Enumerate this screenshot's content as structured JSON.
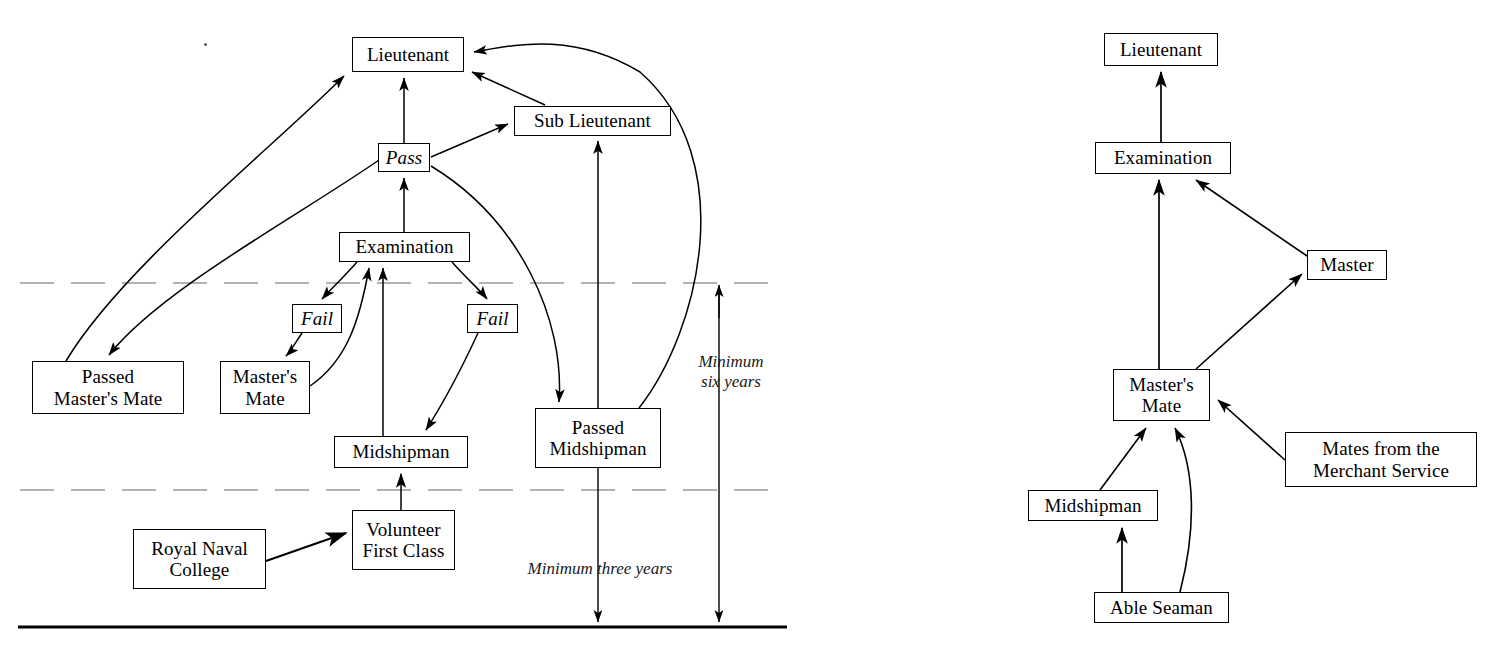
{
  "figure": {
    "kind": "flow-diagram-pair",
    "background": "#ffffff",
    "line_color": "#000000"
  },
  "left_diagram": {
    "name": "executive-officer-career-paths",
    "nodes": [
      {
        "id": "lieutenant",
        "label": "Lieutenant",
        "x": 352,
        "y": 37,
        "w": 112,
        "h": 35,
        "style": "plain"
      },
      {
        "id": "sub_lieutenant",
        "label": "Sub Lieutenant",
        "x": 514,
        "y": 106,
        "w": 157,
        "h": 30,
        "style": "plain"
      },
      {
        "id": "pass",
        "label": "Pass",
        "x": 378,
        "y": 143,
        "w": 52,
        "h": 29,
        "style": "italic"
      },
      {
        "id": "examination",
        "label": "Examination",
        "x": 339,
        "y": 232,
        "w": 131,
        "h": 30,
        "style": "plain"
      },
      {
        "id": "fail_left",
        "label": "Fail",
        "x": 292,
        "y": 304,
        "w": 50,
        "h": 29,
        "style": "italic"
      },
      {
        "id": "fail_right",
        "label": "Fail",
        "x": 467,
        "y": 304,
        "w": 51,
        "h": 29,
        "style": "italic"
      },
      {
        "id": "passed_masters_mate",
        "label": "Passed\nMaster's Mate",
        "x": 32,
        "y": 361,
        "w": 152,
        "h": 53,
        "style": "plain"
      },
      {
        "id": "masters_mate",
        "label": "Master's\nMate",
        "x": 220,
        "y": 361,
        "w": 90,
        "h": 53,
        "style": "plain"
      },
      {
        "id": "midshipman",
        "label": "Midshipman",
        "x": 334,
        "y": 436,
        "w": 134,
        "h": 32,
        "style": "plain"
      },
      {
        "id": "passed_midshipman",
        "label": "Passed\nMidshipman",
        "x": 535,
        "y": 408,
        "w": 126,
        "h": 60,
        "style": "plain"
      },
      {
        "id": "volunteer_first_class",
        "label": "Volunteer\nFirst Class",
        "x": 352,
        "y": 510,
        "w": 103,
        "h": 60,
        "style": "plain"
      },
      {
        "id": "royal_naval_college",
        "label": "Royal Naval\nCollege",
        "x": 133,
        "y": 529,
        "w": 133,
        "h": 60,
        "style": "plain"
      }
    ],
    "annotations": [
      {
        "id": "minimum_six_years",
        "text": "Minimum\nsix years",
        "x": 685,
        "y": 352,
        "w": 92
      },
      {
        "id": "minimum_three_years",
        "text": "Minimum three years",
        "x": 505,
        "y": 559,
        "w": 190
      }
    ],
    "rules": [
      {
        "id": "upper-dashed-rule",
        "y": 283,
        "x1": 20,
        "x2": 785,
        "style": "dashed"
      },
      {
        "id": "lower-dashed-rule",
        "y": 490,
        "x1": 20,
        "x2": 785,
        "style": "dashed"
      },
      {
        "id": "baseline-rule",
        "y": 627,
        "x1": 20,
        "x2": 785,
        "style": "solid"
      }
    ]
  },
  "right_diagram": {
    "name": "master-and-warrant-officer-career-paths",
    "nodes": [
      {
        "id": "r_lieutenant",
        "label": "Lieutenant",
        "x": 1104,
        "y": 33,
        "w": 114,
        "h": 33,
        "style": "plain"
      },
      {
        "id": "r_examination",
        "label": "Examination",
        "x": 1095,
        "y": 142,
        "w": 136,
        "h": 32,
        "style": "plain"
      },
      {
        "id": "r_master",
        "label": "Master",
        "x": 1307,
        "y": 250,
        "w": 80,
        "h": 30,
        "style": "plain"
      },
      {
        "id": "r_masters_mate",
        "label": "Master's\nMate",
        "x": 1113,
        "y": 369,
        "w": 97,
        "h": 52,
        "style": "plain"
      },
      {
        "id": "r_mates",
        "label": "Mates from the\nMerchant Service",
        "x": 1285,
        "y": 432,
        "w": 192,
        "h": 55,
        "style": "plain"
      },
      {
        "id": "r_midshipman",
        "label": "Midshipman",
        "x": 1028,
        "y": 490,
        "w": 130,
        "h": 31,
        "style": "plain"
      },
      {
        "id": "r_able_seaman",
        "label": "Able Seaman",
        "x": 1094,
        "y": 592,
        "w": 135,
        "h": 31,
        "style": "plain"
      }
    ]
  },
  "edges_left": [
    {
      "from": "passed_masters_mate",
      "to": "lieutenant"
    },
    {
      "from": "pass",
      "to": "passed_masters_mate"
    },
    {
      "from": "pass",
      "to": "lieutenant"
    },
    {
      "from": "pass",
      "to": "sub_lieutenant"
    },
    {
      "from": "sub_lieutenant",
      "to": "lieutenant"
    },
    {
      "from": "examination",
      "to": "pass"
    },
    {
      "from": "examination",
      "to": "fail_left"
    },
    {
      "from": "examination",
      "to": "fail_right"
    },
    {
      "from": "fail_left",
      "to": "masters_mate"
    },
    {
      "from": "fail_right",
      "to": "midshipman"
    },
    {
      "from": "midshipman",
      "to": "examination"
    },
    {
      "from": "masters_mate",
      "to": "examination"
    },
    {
      "from": "pass",
      "to": "passed_midshipman"
    },
    {
      "from": "passed_midshipman",
      "to": "sub_lieutenant"
    },
    {
      "from": "passed_midshipman",
      "to": "lieutenant"
    },
    {
      "from": "volunteer_first_class",
      "to": "midshipman"
    },
    {
      "from": "royal_naval_college",
      "to": "volunteer_first_class"
    }
  ],
  "edges_right": [
    {
      "from": "r_examination",
      "to": "r_lieutenant"
    },
    {
      "from": "r_masters_mate",
      "to": "r_examination"
    },
    {
      "from": "r_master",
      "to": "r_examination"
    },
    {
      "from": "r_masters_mate",
      "to": "r_master"
    },
    {
      "from": "r_midshipman",
      "to": "r_masters_mate"
    },
    {
      "from": "r_able_seaman",
      "to": "r_masters_mate"
    },
    {
      "from": "r_able_seaman",
      "to": "r_midshipman"
    },
    {
      "from": "r_mates",
      "to": "r_masters_mate"
    }
  ]
}
